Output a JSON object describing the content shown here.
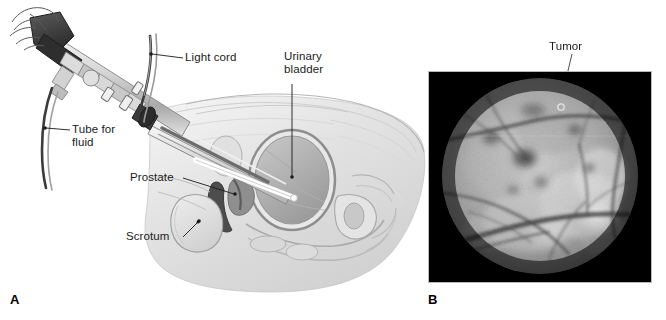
{
  "figure": {
    "background_color": "#ffffff",
    "width": 666,
    "height": 320,
    "panels": [
      {
        "letter": "A",
        "name": "cystoscopy-illustration",
        "description": "Line drawing of a cystoscope inserted through the urethra into the urinary bladder, sagittal male pelvis view"
      },
      {
        "letter": "B",
        "name": "cystoscopic-photograph",
        "description": "Black-and-white endoscopic photograph of bladder mucosa with a tumor"
      }
    ]
  },
  "panel_a": {
    "letter": "A",
    "labels": [
      {
        "id": "light-cord",
        "text": "Light cord"
      },
      {
        "id": "urinary-bladder",
        "text": "Urinary\nbladder"
      },
      {
        "id": "tube-for-fluid",
        "text": "Tube for\nfluid"
      },
      {
        "id": "prostate",
        "text": "Prostate"
      },
      {
        "id": "scrotum",
        "text": "Scrotum"
      }
    ]
  },
  "panel_b": {
    "letter": "B",
    "labels": [
      {
        "id": "tumor",
        "text": "Tumor"
      }
    ],
    "image_background": "#000000"
  },
  "colors": {
    "text": "#1a1a1a",
    "leader_line": "#1a1a1a",
    "outline": "#4a4a4a",
    "tissue_light": "#ededed",
    "tissue_mid": "#d4d4d4",
    "tissue_dark": "#a8a8a8",
    "scope_dark": "#3a3a3a",
    "scope_metal": "#c8c8c8",
    "panel_b_bg": "#000000",
    "panel_b_border": "#b9b9b9"
  }
}
